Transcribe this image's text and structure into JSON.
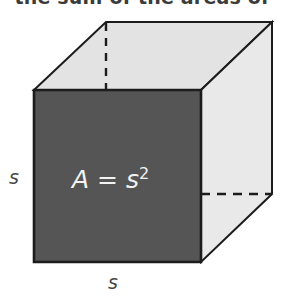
{
  "heading": {
    "text": "the sum of the areas of",
    "state": "clipped-top"
  },
  "figure": {
    "name": "cube-diagram",
    "shape": "cube",
    "labels": {
      "left_side": "s",
      "bottom_side": "s",
      "front_face_formula": "A = s",
      "front_face_exponent": "2"
    },
    "colors": {
      "front_face": "#555555",
      "top_face": "#e3e3e3",
      "right_face": "#e9e9e9",
      "outline": "#1c1c1c",
      "hidden_edge": "#1c1c1c",
      "background": "#ffffff",
      "label_text": "#474747",
      "front_label_text": "#f2f2f2"
    },
    "geometry": {
      "front_face": [
        [
          34,
          90
        ],
        [
          201,
          90
        ],
        [
          201,
          262
        ],
        [
          34,
          262
        ]
      ],
      "top_face": [
        [
          34,
          90
        ],
        [
          106,
          22
        ],
        [
          272,
          22
        ],
        [
          201,
          90
        ]
      ],
      "right_face": [
        [
          201,
          90
        ],
        [
          272,
          22
        ],
        [
          272,
          194
        ],
        [
          201,
          262
        ]
      ],
      "hidden_vertical_edge": [
        [
          106,
          22
        ],
        [
          106,
          90
        ]
      ],
      "hidden_horizontal_edge": [
        [
          201,
          194
        ],
        [
          272,
          194
        ]
      ]
    }
  }
}
